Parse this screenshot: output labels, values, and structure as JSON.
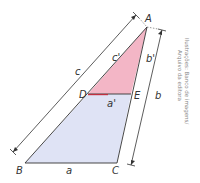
{
  "diagram": {
    "type": "similar-triangles",
    "vertices": {
      "A": {
        "label": "A",
        "x": 147,
        "y": 27
      },
      "B": {
        "label": "B",
        "x": 25,
        "y": 163
      },
      "C": {
        "label": "C",
        "x": 117,
        "y": 163
      },
      "D": {
        "label": "D",
        "x": 88,
        "y": 94
      },
      "E": {
        "label": "E",
        "x": 131,
        "y": 94
      }
    },
    "side_labels": {
      "a": "a",
      "b": "b",
      "c": "c",
      "a_prime": "a'",
      "b_prime": "b'",
      "c_prime": "c'"
    },
    "colors": {
      "small_triangle_fill": "#f3b6c6",
      "trapezoid_fill": "#dfe3f5",
      "lines": "#333333",
      "de_segment": "#c0303f"
    },
    "credit": {
      "line1": "Ilustrações: Banco de imagens/",
      "line2": "Arquivo da editora"
    }
  }
}
